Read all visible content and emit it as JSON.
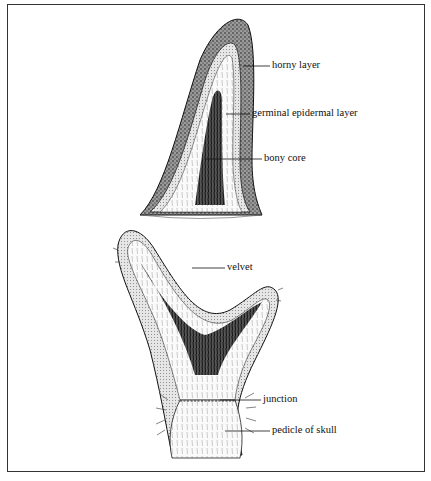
{
  "figure": {
    "type": "anatomical illustration",
    "panels": [
      {
        "id": "horn",
        "labels": {
          "horny_layer": "horny layer",
          "germinal_epidermal_layer": "germinal epidermal layer",
          "bony_core": "bony core"
        }
      },
      {
        "id": "antler",
        "labels": {
          "velvet": "velvet",
          "junction": "junction",
          "pedicle_of_skull": "pedicle of skull"
        }
      }
    ]
  },
  "colors": {
    "ink": "#111111",
    "background": "#ffffff",
    "border": "#333333"
  }
}
